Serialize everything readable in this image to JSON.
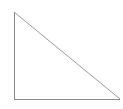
{
  "canvas": {
    "width": 123,
    "height": 109,
    "background_color": "#ffffff"
  },
  "figure": {
    "name": "right-triangle",
    "type": "line-drawing",
    "stroke_color": "#8a8a8a",
    "hypotenuse_color": "#9a9a9a",
    "fill_color": "none",
    "stroke_width": 1,
    "vertices": [
      {
        "label": "apex-top-left",
        "x": 14,
        "y": 12
      },
      {
        "label": "right-angle-bottom-left",
        "x": 14,
        "y": 99
      },
      {
        "label": "bottom-right",
        "x": 120,
        "y": 99
      }
    ],
    "edges": [
      {
        "name": "vertical-leg",
        "from": "apex-top-left",
        "to": "right-angle-bottom-left",
        "orientation": "vertical"
      },
      {
        "name": "horizontal-leg",
        "from": "right-angle-bottom-left",
        "to": "bottom-right",
        "orientation": "horizontal"
      },
      {
        "name": "hypotenuse",
        "from": "apex-top-left",
        "to": "bottom-right",
        "orientation": "diagonal"
      }
    ],
    "path_d": "M 14 12 L 14 99 L 120 99 Z"
  }
}
